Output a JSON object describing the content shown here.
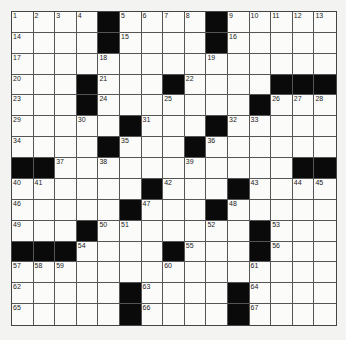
{
  "puzzle": {
    "rows": 15,
    "cols": 15,
    "colors": {
      "black": "#0a0a0a",
      "white": "#fbfbf9",
      "line": "#555555",
      "background": "#f3f3f1"
    },
    "grid": [
      [
        "1",
        "2",
        "3",
        "4",
        "#",
        "5",
        "6",
        "7",
        "8",
        "#",
        "9",
        "10",
        "11",
        "12",
        "13"
      ],
      [
        "14",
        "",
        "",
        "",
        "#",
        "15",
        "",
        "",
        "",
        "#",
        "16",
        "",
        "",
        "",
        ""
      ],
      [
        "17",
        "",
        "",
        "",
        "18",
        "",
        "",
        "",
        "",
        "19",
        "",
        "",
        "",
        "",
        ""
      ],
      [
        "20",
        "",
        "",
        "#",
        "21",
        "",
        "",
        "#",
        "22",
        "",
        "",
        "",
        "#",
        "#",
        "#"
      ],
      [
        "23",
        "",
        "",
        "#",
        "24",
        "",
        "",
        "25",
        "",
        "",
        "",
        "#",
        "26",
        "27",
        "28"
      ],
      [
        "29",
        "",
        "",
        "30",
        "",
        "#",
        "31",
        "",
        "",
        "#",
        "32",
        "33",
        "",
        "",
        ""
      ],
      [
        "34",
        "",
        "",
        "",
        "#",
        "35",
        "",
        "",
        "#",
        "36",
        "",
        "",
        "",
        "",
        ""
      ],
      [
        "#",
        "#",
        "37",
        "",
        "38",
        "",
        "",
        "",
        "39",
        "",
        "",
        "",
        "",
        "#",
        "#"
      ],
      [
        "40",
        "41",
        "",
        "",
        "",
        "",
        "#",
        "42",
        "",
        "",
        "#",
        "43",
        "",
        "44",
        "45"
      ],
      [
        "46",
        "",
        "",
        "",
        "",
        "#",
        "47",
        "",
        "",
        "#",
        "48",
        "",
        "",
        "",
        ""
      ],
      [
        "49",
        "",
        "",
        "#",
        "50",
        "51",
        "",
        "",
        "",
        "52",
        "",
        "#",
        "53",
        "",
        ""
      ],
      [
        "#",
        "#",
        "#",
        "54",
        "",
        "",
        "",
        "#",
        "55",
        "",
        "",
        "#",
        "56",
        "",
        ""
      ],
      [
        "57",
        "58",
        "59",
        "",
        "",
        "",
        "",
        "60",
        "",
        "",
        "",
        "61",
        "",
        "",
        ""
      ],
      [
        "62",
        "",
        "",
        "",
        "",
        "#",
        "63",
        "",
        "",
        "",
        "#",
        "64",
        "",
        "",
        ""
      ],
      [
        "65",
        "",
        "",
        "",
        "",
        "#",
        "66",
        "",
        "",
        "",
        "#",
        "67",
        "",
        "",
        ""
      ]
    ]
  }
}
